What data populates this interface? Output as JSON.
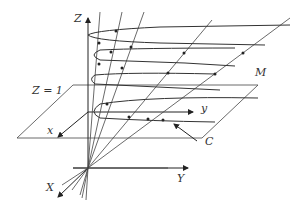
{
  "figure": {
    "labels": {
      "Z": "Z",
      "plane": "Z = 1",
      "x_small": "x",
      "y_small": "y",
      "X": "X",
      "Y": "Y",
      "M": "M",
      "C": "C"
    },
    "colors": {
      "stroke": "#333333",
      "background": "#ffffff"
    }
  }
}
